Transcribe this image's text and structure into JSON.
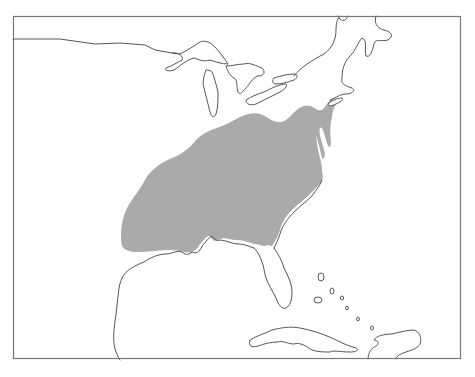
{
  "map": {
    "type": "range-map",
    "region": "Eastern North America",
    "frame": {
      "x": 13,
      "y": 16,
      "width": 448,
      "height": 343
    },
    "colors": {
      "background": "#ffffff",
      "land_outline": "#555555",
      "range_fill": "#aaaaaa",
      "frame": "#777777"
    },
    "features": [
      {
        "name": "shaded-range",
        "description": "Eastern United States range area"
      },
      {
        "name": "great-lakes"
      },
      {
        "name": "florida-peninsula"
      },
      {
        "name": "gulf-of-mexico-coast"
      },
      {
        "name": "bahamas-islands"
      },
      {
        "name": "cuba"
      },
      {
        "name": "hispaniola"
      }
    ]
  }
}
